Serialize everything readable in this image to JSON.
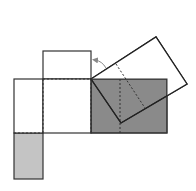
{
  "diagram": {
    "type": "geometric-net-folding",
    "colors": {
      "stroke": "#333333",
      "dark_fill": "#8a8a8a",
      "light_fill": "#c4c4c4",
      "white_fill": "#ffffff",
      "arrow": "#888888"
    },
    "shapes": {
      "top_square": {
        "x": 43,
        "y": 51,
        "w": 48,
        "h": 28
      },
      "left_rect": {
        "x": 14,
        "y": 79,
        "w": 29,
        "h": 54
      },
      "center_square": {
        "x": 43,
        "y": 79,
        "w": 48,
        "h": 54
      },
      "bottom_grey": {
        "x": 14,
        "y": 133,
        "w": 29,
        "h": 46
      },
      "dark_rect": {
        "x": 91,
        "y": 79,
        "w": 76,
        "h": 54
      },
      "rotated_square": "91,79 156,37 187,84 121,123"
    }
  }
}
